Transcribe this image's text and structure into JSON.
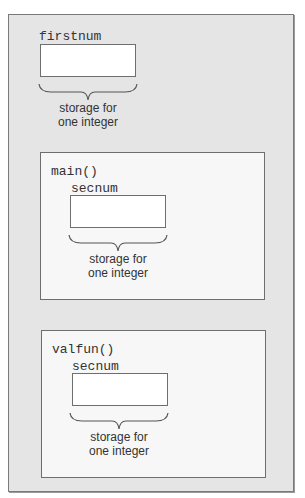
{
  "diagram": {
    "cutoff_text": "… variable scope diagram …",
    "colors": {
      "outer_background": "#e5e5e5",
      "function_background": "#f7f7f7",
      "storage_background": "#ffffff",
      "border": "#6e6e6e",
      "text": "#333333"
    },
    "global": {
      "variable_name": "firstnum",
      "caption_line1": "storage for",
      "caption_line2": "one integer"
    },
    "functions": [
      {
        "name": "main()",
        "variable_name": "secnum",
        "caption_line1": "storage for",
        "caption_line2": "one integer"
      },
      {
        "name": "valfun()",
        "variable_name": "secnum",
        "caption_line1": "storage for",
        "caption_line2": "one integer"
      }
    ]
  }
}
